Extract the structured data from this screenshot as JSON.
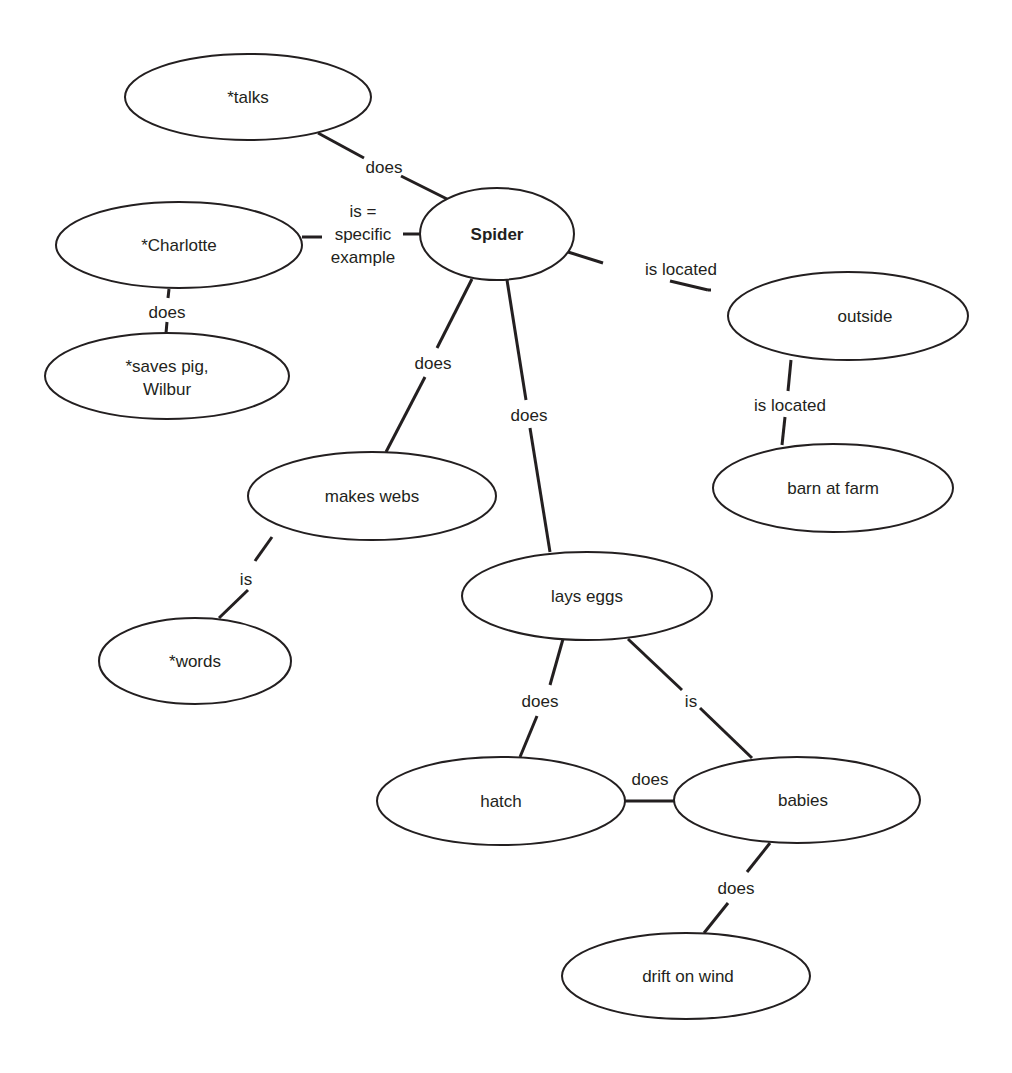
{
  "diagram": {
    "type": "concept-map",
    "central_concept": "Spider",
    "nodes": [
      {
        "id": "spider",
        "label": "Spider",
        "bold": true,
        "cx": 497,
        "cy": 234,
        "rx": 77,
        "ry": 46
      },
      {
        "id": "talks",
        "label": "*talks",
        "cx": 248,
        "cy": 97,
        "rx": 123,
        "ry": 43
      },
      {
        "id": "charlotte",
        "label": "*Charlotte",
        "cx": 179,
        "cy": 245,
        "rx": 123,
        "ry": 43
      },
      {
        "id": "saves-pig",
        "label_lines": [
          "*saves pig,",
          "Wilbur"
        ],
        "cx": 167,
        "cy": 376,
        "rx": 122,
        "ry": 43
      },
      {
        "id": "outside",
        "label": "outside",
        "cx": 848,
        "cy": 316,
        "rx": 120,
        "ry": 44
      },
      {
        "id": "barn",
        "label": "barn at farm",
        "cx": 833,
        "cy": 488,
        "rx": 120,
        "ry": 44
      },
      {
        "id": "makes-webs",
        "label": "makes webs",
        "cx": 372,
        "cy": 496,
        "rx": 124,
        "ry": 44
      },
      {
        "id": "lays-eggs",
        "label": "lays eggs",
        "cx": 587,
        "cy": 596,
        "rx": 125,
        "ry": 44
      },
      {
        "id": "words",
        "label": "*words",
        "cx": 195,
        "cy": 661,
        "rx": 96,
        "ry": 43
      },
      {
        "id": "hatch",
        "label": "hatch",
        "cx": 501,
        "cy": 801,
        "rx": 124,
        "ry": 44
      },
      {
        "id": "babies",
        "label": "babies",
        "cx": 797,
        "cy": 800,
        "rx": 123,
        "ry": 43
      },
      {
        "id": "drift",
        "label": "drift on wind",
        "cx": 686,
        "cy": 976,
        "rx": 124,
        "ry": 43
      }
    ],
    "edges": [
      {
        "from": "spider",
        "to": "talks",
        "label": "does"
      },
      {
        "from": "spider",
        "to": "charlotte",
        "label_lines": [
          "is =",
          "specific",
          "example"
        ]
      },
      {
        "from": "charlotte",
        "to": "saves-pig",
        "label": "does"
      },
      {
        "from": "spider",
        "to": "outside",
        "label": "is located"
      },
      {
        "from": "outside",
        "to": "barn",
        "label": "is located"
      },
      {
        "from": "spider",
        "to": "makes-webs",
        "label": "does"
      },
      {
        "from": "spider",
        "to": "lays-eggs",
        "label": "does"
      },
      {
        "from": "makes-webs",
        "to": "words",
        "label": "is"
      },
      {
        "from": "lays-eggs",
        "to": "hatch",
        "label": "does"
      },
      {
        "from": "lays-eggs",
        "to": "babies",
        "label": "is"
      },
      {
        "from": "babies",
        "to": "hatch",
        "label": "does"
      },
      {
        "from": "babies",
        "to": "drift",
        "label": "does"
      }
    ]
  },
  "labels": {
    "spider": "Spider",
    "talks": "*talks",
    "charlotte": "*Charlotte",
    "saves_pig_line1": "*saves pig,",
    "saves_pig_line2": "Wilbur",
    "outside": "outside",
    "barn": "barn at farm",
    "makes_webs": "makes webs",
    "lays_eggs": "lays eggs",
    "words": "*words",
    "hatch": "hatch",
    "babies": "babies",
    "drift": "drift on wind",
    "edge_spider_talks": "does",
    "edge_spider_charlotte_1": "is =",
    "edge_spider_charlotte_2": "specific",
    "edge_spider_charlotte_3": "example",
    "edge_charlotte_saves": "does",
    "edge_spider_outside": "is located",
    "edge_outside_barn": "is located",
    "edge_spider_webs": "does",
    "edge_spider_eggs": "does",
    "edge_webs_words": "is",
    "edge_eggs_hatch": "does",
    "edge_eggs_babies": "is",
    "edge_hatch_babies": "does",
    "edge_babies_drift": "does"
  }
}
